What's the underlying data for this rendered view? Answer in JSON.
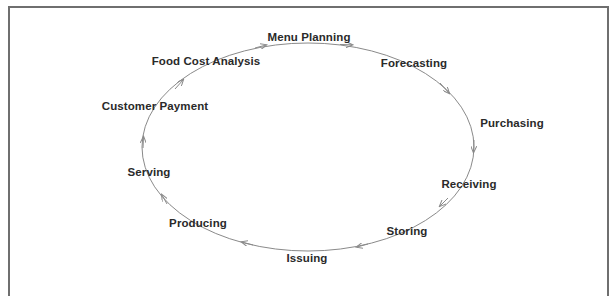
{
  "diagram": {
    "type": "cycle",
    "line_color": "#8a8a8a",
    "text_color": "#2a2a2a",
    "border_color": "#6f6f6f",
    "steps": [
      {
        "label": "Menu Planning",
        "x": 309,
        "y": 37
      },
      {
        "label": "Forecasting",
        "x": 414,
        "y": 63
      },
      {
        "label": "Purchasing",
        "x": 512,
        "y": 123
      },
      {
        "label": "Receiving",
        "x": 469,
        "y": 184
      },
      {
        "label": "Storing",
        "x": 407,
        "y": 231
      },
      {
        "label": "Issuing",
        "x": 307,
        "y": 258
      },
      {
        "label": "Producing",
        "x": 198,
        "y": 223
      },
      {
        "label": "Serving",
        "x": 149,
        "y": 172
      },
      {
        "label": "Customer Payment",
        "x": 155,
        "y": 106
      },
      {
        "label": "Food Cost Analysis",
        "x": 206,
        "y": 61
      }
    ]
  }
}
